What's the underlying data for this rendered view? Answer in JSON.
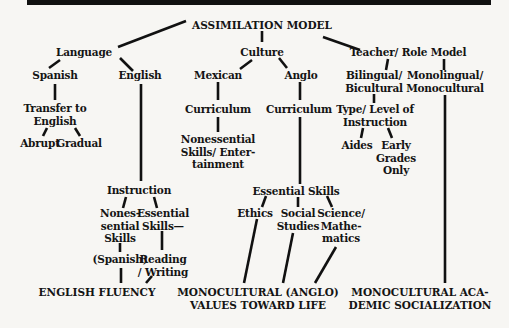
{
  "diagram": {
    "title": "ASSIMILATION MODEL",
    "nodes": {
      "root": "ASSIMILATION MODEL",
      "language": "Language",
      "culture": "Culture",
      "teacher": "Teacher/ Role Model",
      "spanish": "Spanish",
      "english": "English",
      "mexican": "Mexican",
      "anglo": "Anglo",
      "bilingual": "Bilingual/\nBicultural",
      "monolingual": "Monolingual/\nMonocultural",
      "transfer": "Transfer to\nEnglish",
      "abrupt": "Abrupt",
      "gradual": "Gradual",
      "curriculum_mexican": "Curriculum",
      "curriculum_anglo": "Curriculum",
      "type_level": "Type/ Level of\nInstruction",
      "nonessential_entertainment": "Nonessential\nSkills/ Enter-\ntainment",
      "aides": "Aides",
      "early_grades": "Early\nGrades\nOnly",
      "instruction": "Instruction",
      "essential_skills_anglo": "Essential Skills",
      "nonessential_skills": "Nones-\nsential\nSkills",
      "essential_skills_english": "Essential\nSkills—",
      "ethics": "Ethics",
      "social_studies": "Social\nStudies",
      "science_math": "Science/\nMathe-\nmatics",
      "spanish_paren": "(Spanish)",
      "reading_writing": "Reading\n/ Writing",
      "english_fluency": "ENGLISH FLUENCY",
      "monocultural_values": "MONOCULTURAL (ANGLO)\nVALUES TOWARD LIFE",
      "monocultural_academic": "MONOCULTURAL ACA-\nDEMIC SOCIALIZATION"
    },
    "edges": [
      [
        "root",
        "language"
      ],
      [
        "root",
        "culture"
      ],
      [
        "root",
        "teacher"
      ],
      [
        "language",
        "spanish"
      ],
      [
        "language",
        "english"
      ],
      [
        "spanish",
        "transfer"
      ],
      [
        "transfer",
        "abrupt"
      ],
      [
        "transfer",
        "gradual"
      ],
      [
        "english",
        "instruction"
      ],
      [
        "instruction",
        "nonessential_skills"
      ],
      [
        "instruction",
        "essential_skills_english"
      ],
      [
        "nonessential_skills",
        "spanish_paren"
      ],
      [
        "essential_skills_english",
        "reading_writing"
      ],
      [
        "spanish_paren",
        "english_fluency"
      ],
      [
        "reading_writing",
        "english_fluency"
      ],
      [
        "culture",
        "mexican"
      ],
      [
        "culture",
        "anglo"
      ],
      [
        "mexican",
        "curriculum_mexican"
      ],
      [
        "curriculum_mexican",
        "nonessential_entertainment"
      ],
      [
        "anglo",
        "curriculum_anglo"
      ],
      [
        "curriculum_anglo",
        "essential_skills_anglo"
      ],
      [
        "essential_skills_anglo",
        "ethics"
      ],
      [
        "essential_skills_anglo",
        "social_studies"
      ],
      [
        "essential_skills_anglo",
        "science_math"
      ],
      [
        "ethics",
        "monocultural_values"
      ],
      [
        "social_studies",
        "monocultural_values"
      ],
      [
        "science_math",
        "monocultural_values"
      ],
      [
        "teacher",
        "bilingual"
      ],
      [
        "teacher",
        "monolingual"
      ],
      [
        "bilingual",
        "type_level"
      ],
      [
        "type_level",
        "aides"
      ],
      [
        "type_level",
        "early_grades"
      ],
      [
        "monolingual",
        "monocultural_academic"
      ]
    ]
  }
}
